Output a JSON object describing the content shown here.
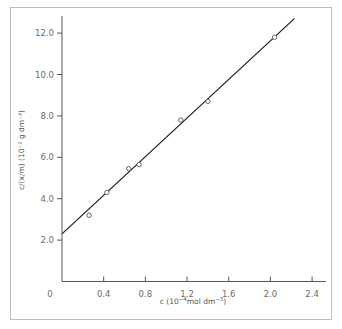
{
  "chart_data": {
    "type": "scatter",
    "title": "",
    "xlabel": "c (10⁻⁴ mol dm⁻³)",
    "ylabel": "c/(x/m) (10⁻² g dm⁻³)",
    "xlim": [
      0,
      2.4
    ],
    "ylim": [
      0,
      13.0
    ],
    "x_ticks": [
      "0",
      "0.4",
      "0.8",
      "1.2",
      "1.6",
      "2.0",
      "2.4"
    ],
    "y_ticks": [
      "2.0",
      "4.0",
      "6.0",
      "8.0",
      "10.0",
      "12.0"
    ],
    "grid": false,
    "legend": null,
    "series": [
      {
        "name": "data",
        "marker": "open-circle",
        "x": [
          0.26,
          0.43,
          0.64,
          0.74,
          1.14,
          1.4,
          2.04
        ],
        "y": [
          3.2,
          4.3,
          5.45,
          5.65,
          7.8,
          8.7,
          11.8
        ]
      },
      {
        "name": "fit",
        "style": "line",
        "x": [
          0.0,
          2.23
        ],
        "y": [
          2.3,
          12.7
        ]
      }
    ]
  },
  "labels": {
    "xlabel_prefix": "c (10",
    "xlabel_exp": "−4",
    "xlabel_mid": "mol dm",
    "xlabel_exp2": "−3",
    "xlabel_suffix": ")",
    "ylabel_text": "c/(x/m) (10⁻² g dm⁻³)"
  },
  "colors": {
    "axis": "#555555",
    "line": "#222222",
    "marker": "#555555",
    "frame": "#bdbdbd",
    "tick_text": "#6d6d6d"
  }
}
